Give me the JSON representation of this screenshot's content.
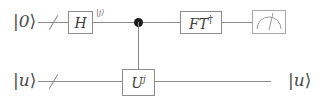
{
  "diagram": {
    "type": "quantum-circuit",
    "width": 325,
    "height": 105,
    "background_color": "#ffffff",
    "wire_color": "#8a8a8a",
    "box_border_color": "#8c8c8c",
    "text_color": "#4a4a4a",
    "control_dot_color": "#1c1c1c"
  },
  "wires": [
    {
      "id": "control-register",
      "input_label": "|0⟩",
      "input_label_bar": "|",
      "input_label_symbol": "0",
      "input_label_angle": "⟩",
      "has_bundle_slash": true,
      "y": 22
    },
    {
      "id": "target-register",
      "input_label": "|u⟩",
      "input_label_bar": "|",
      "input_label_symbol": "u",
      "input_label_angle": "⟩",
      "output_label": "|u⟩",
      "output_label_bar": "|",
      "output_label_symbol": "u",
      "output_label_angle": "⟩",
      "has_bundle_slash": true,
      "y": 81
    }
  ],
  "gates": [
    {
      "id": "hadamard",
      "label": "H",
      "base": "H",
      "superscript": "",
      "wire": "control-register"
    },
    {
      "id": "controlled-u",
      "label": "U^j",
      "base": "U",
      "superscript": "j",
      "wire": "target-register",
      "control_wire": "control-register"
    },
    {
      "id": "inverse-fourier-transform",
      "label": "FT†",
      "base": "FT",
      "superscript": "†",
      "wire": "control-register"
    },
    {
      "id": "measurement",
      "label": "",
      "icon": "meter-gauge-icon",
      "wire": "control-register"
    }
  ],
  "annotations": [
    {
      "id": "state-after-hadamard",
      "text": "|j⟩",
      "bar": "|",
      "symbol": "j",
      "angle": "⟩",
      "wire": "control-register"
    }
  ]
}
